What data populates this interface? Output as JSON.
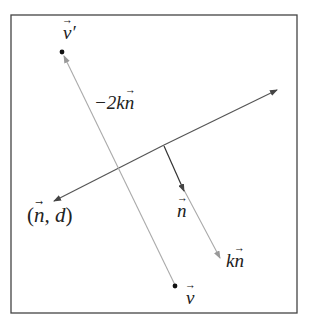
{
  "diagram": {
    "labels": {
      "v_prime": "v",
      "v_prime_mark": "′",
      "minus_two_k_n_prefix": "−2k",
      "minus_two_k_n_vec": "n",
      "plane_open": "(",
      "plane_n": "n",
      "plane_rest": ", d",
      "plane_close": ")",
      "n": "n",
      "k_n_prefix": "k",
      "k_n_vec": "n",
      "v": "v"
    },
    "colors": {
      "frame": "#444444",
      "plane_line": "#555555",
      "normal": "#333333",
      "reflection_line": "#aaaaaa",
      "points": "#111111"
    }
  }
}
